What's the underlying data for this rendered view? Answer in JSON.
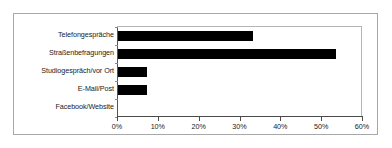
{
  "chart_data": {
    "type": "bar",
    "orientation": "horizontal",
    "title": "",
    "subtitle": "",
    "xlabel": "",
    "ylabel": "",
    "categories": [
      "Telefongespräche",
      "Straßenbefragungen",
      "Studiogespräch/vor Ort",
      "E-Mail/Post",
      "Facebook/Website"
    ],
    "values": [
      33,
      53.5,
      7,
      7,
      0
    ],
    "value_suffix": "%",
    "xlim": [
      0,
      60
    ],
    "xticks": [
      0,
      10,
      20,
      30,
      40,
      50,
      60
    ],
    "xtick_labels": [
      "0%",
      "10%",
      "20%",
      "30%",
      "40%",
      "50%",
      "60%"
    ],
    "grid": false,
    "legend": false,
    "legend_position": "none",
    "bar_color": "#000000",
    "plot_background": "#ffffff",
    "frame_color": "#a8a8a8",
    "axis_color": "#4a4a4a"
  }
}
